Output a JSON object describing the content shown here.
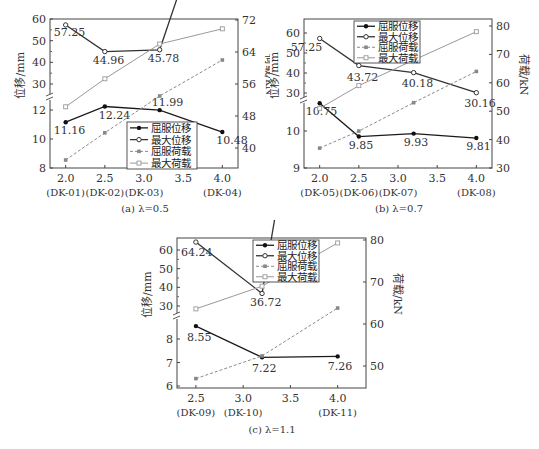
{
  "chart_data": [
    {
      "id": "a",
      "type": "line",
      "caption": "(a) λ=0.5",
      "xlabel": "",
      "x": [
        2.0,
        2.5,
        3.2,
        4.0
      ],
      "xticks": [
        {
          "v": 2.0,
          "label": "2.0",
          "sub": "(DK-01)"
        },
        {
          "v": 2.5,
          "label": "2.5",
          "sub": "(DK-02)"
        },
        {
          "v": 3.0,
          "label": "3.0",
          "sub": "(DK-03)"
        },
        {
          "v": 3.5,
          "label": "3.5",
          "sub": ""
        },
        {
          "v": 4.0,
          "label": "4.0",
          "sub": "(DK-04)"
        }
      ],
      "ylabel_left": "位移/mm",
      "ylabel_right": "荷载/kN",
      "left_axis_broken": true,
      "left_upper_ticks": [
        30,
        40,
        50,
        60
      ],
      "left_lower_ticks": [
        8,
        10,
        12
      ],
      "right_ticks": [
        40,
        48,
        56,
        64,
        72
      ],
      "right_ylim": [
        35,
        72
      ],
      "legend": [
        "屈服位移",
        "最大位移",
        "屈服荷载",
        "最大荷载"
      ],
      "series": [
        {
          "name": "屈服位移",
          "axis": "left",
          "values": [
            11.16,
            12.24,
            11.99,
            10.48
          ],
          "labels": [
            "11.16",
            "12.24",
            "11.99",
            "10.48"
          ]
        },
        {
          "name": "最大位移",
          "axis": "left",
          "values": [
            57.25,
            44.96,
            45.78,
            28.93
          ],
          "labels": [
            "57.25",
            "44.96",
            "45.78",
            "28.93"
          ]
        },
        {
          "name": "屈服荷载",
          "axis": "right",
          "values": [
            37.0,
            43.8,
            53.0,
            62.0
          ]
        },
        {
          "name": "最大荷载",
          "axis": "right",
          "values": [
            50.3,
            57.3,
            66.0,
            69.8
          ]
        }
      ]
    },
    {
      "id": "b",
      "type": "line",
      "caption": "(b) λ=0.7",
      "x": [
        2.0,
        2.5,
        3.2,
        4.0
      ],
      "xticks": [
        {
          "v": 2.0,
          "label": "2.0",
          "sub": "(DK-05)"
        },
        {
          "v": 2.5,
          "label": "2.5",
          "sub": "(DK-06)"
        },
        {
          "v": 3.0,
          "label": "3.0",
          "sub": "(DK-07)"
        },
        {
          "v": 3.5,
          "label": "3.5",
          "sub": ""
        },
        {
          "v": 4.0,
          "label": "4.0",
          "sub": "(DK-08)"
        }
      ],
      "ylabel_left": "位移/mm",
      "ylabel_right": "荷载/kN",
      "left_axis_broken": true,
      "left_upper_ticks": [
        30,
        40,
        50,
        60
      ],
      "left_lower_ticks": [
        9,
        10
      ],
      "right_ticks": [
        30,
        40,
        50,
        60,
        70,
        80
      ],
      "right_ylim": [
        30,
        80
      ],
      "legend": [
        "屈服位移",
        "最大位移",
        "屈服荷载",
        "最大荷载"
      ],
      "series": [
        {
          "name": "屈服位移",
          "axis": "left",
          "values": [
            10.75,
            9.85,
            9.93,
            9.81
          ],
          "labels": [
            "10.75",
            "9.85",
            "9.93",
            "9.81"
          ]
        },
        {
          "name": "最大位移",
          "axis": "left",
          "values": [
            57.25,
            43.72,
            40.18,
            30.16
          ],
          "labels": [
            "57.25",
            "43.72",
            "40.18",
            "30.16"
          ]
        },
        {
          "name": "屈服荷载",
          "axis": "right",
          "values": [
            37.0,
            43.0,
            53.0,
            64.0
          ]
        },
        {
          "name": "最大荷载",
          "axis": "right",
          "values": [
            51.0,
            59.0,
            68.0,
            78.0
          ]
        }
      ]
    },
    {
      "id": "c",
      "type": "line",
      "caption": "(c) λ=1.1",
      "x": [
        2.5,
        3.2,
        4.0
      ],
      "xticks": [
        {
          "v": 2.5,
          "label": "2.5",
          "sub": "(DK-09)"
        },
        {
          "v": 3.0,
          "label": "3.0",
          "sub": "(DK-10)"
        },
        {
          "v": 3.5,
          "label": "3.5",
          "sub": ""
        },
        {
          "v": 4.0,
          "label": "4.0",
          "sub": "(DK-11)"
        }
      ],
      "ylabel_left": "位移/mm",
      "ylabel_right": "荷载/kN",
      "left_axis_broken": true,
      "left_upper_ticks": [
        30,
        40,
        50,
        60
      ],
      "left_lower_ticks": [
        6,
        7,
        8
      ],
      "right_ticks": [
        50,
        60,
        70,
        80
      ],
      "right_ylim": [
        45,
        80
      ],
      "legend": [
        "屈服位移",
        "最大位移",
        "屈服荷载",
        "最大荷载"
      ],
      "series": [
        {
          "name": "屈服位移",
          "axis": "left",
          "values": [
            8.55,
            7.22,
            7.26
          ],
          "labels": [
            "8.55",
            "7.22",
            "7.26"
          ]
        },
        {
          "name": "最大位移",
          "axis": "left",
          "values": [
            64.24,
            36.72,
            28.89
          ],
          "labels": [
            "64.24",
            "36.72",
            "28.89"
          ]
        },
        {
          "name": "屈服荷载",
          "axis": "right",
          "values": [
            47.0,
            52.4,
            63.8
          ]
        },
        {
          "name": "最大荷载",
          "axis": "right",
          "values": [
            63.6,
            69.0,
            79.3
          ]
        }
      ]
    }
  ],
  "captions": {
    "a": "(a) λ=0.5",
    "b": "(b) λ=0.7",
    "c": "(c) λ=1.1"
  }
}
